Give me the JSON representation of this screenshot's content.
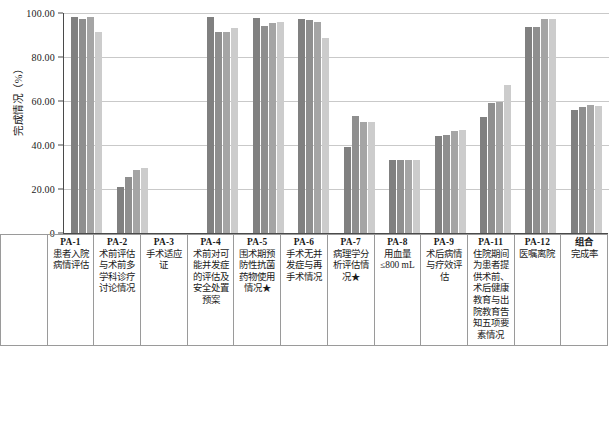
{
  "chart_data": {
    "type": "bar",
    "title": "",
    "xlabel": "",
    "ylabel": "完成情况（%）",
    "ylim": [
      0,
      100
    ],
    "yticks": [
      "0",
      "20.00",
      "40.00",
      "60.00",
      "80.00",
      "100.00"
    ],
    "grid": true,
    "legend_position": "table-left-column",
    "categories": [
      "PA-1",
      "PA-2",
      "PA-3",
      "PA-4",
      "PA-5",
      "PA-6",
      "PA-7",
      "PA-8",
      "PA-9",
      "PA-11",
      "PA-12",
      "组合"
    ],
    "category_descriptions": [
      "患者入院病情评估",
      "术前评估与术前多学科诊疗讨论情况",
      "手术适应证",
      "术前对可能并发症的评估及安全处置预案",
      "围术期预防性抗菌药物使用情况★",
      "手术无并发症与再手术情况",
      "病理学分析评估情况★",
      "用血量≤800 mL",
      "术后病情与疗效评估",
      "住院期间为患者提供术前、术后健康教育与出院教育告知五项要素情况",
      "医嘱离院",
      "完成率"
    ],
    "series": [
      {
        "name": "2019年113例",
        "color": "#808080",
        "values": [
          98.23,
          20.72,
          0,
          98.23,
          97.53,
          97.35,
          38.94,
          33.33,
          43.95,
          52.83,
          93.81,
          56.14
        ]
      },
      {
        "name": "2020年7244例",
        "color": "#8f8f8f",
        "values": [
          97.45,
          25.68,
          0,
          91.2,
          94.15,
          96.81,
          53.13,
          33.32,
          44.34,
          58.95,
          93.53,
          57.34
        ]
      },
      {
        "name": "2021年8237例",
        "color": "#a5a5a5",
        "values": [
          98.2,
          28.6,
          0,
          91.47,
          95.59,
          95.95,
          50.58,
          33.28,
          46.52,
          59.65,
          97.43,
          58.09
        ]
      },
      {
        "name": "2022年8070例",
        "color": "#cccccc",
        "values": [
          91.2,
          29.68,
          0,
          93.06,
          95.85,
          88.48,
          50.54,
          33.31,
          46.65,
          67.09,
          97.46,
          57.8
        ]
      }
    ]
  },
  "table": {
    "header_pa": [
      "PA-1",
      "PA-2",
      "PA-3",
      "PA-4",
      "PA-5",
      "PA-6",
      "PA-7",
      "PA-8",
      "PA-9",
      "PA-11",
      "PA-12",
      "组合"
    ],
    "header_desc": [
      "患者入院病情评估",
      "术前评估与术前多学科诊疗讨论情况",
      "手术适应证",
      "术前对可能并发症的评估及安全处置预案",
      "围术期预防性抗菌药物使用情况★",
      "手术无并发症与再手术情况",
      "病理学分析评估情况★",
      "用血量≤800 mL",
      "术后病情与疗效评估",
      "住院期间为患者提供术前、术后健康教育与出院教育告知五项要素情况",
      "医嘱离院",
      "完成率"
    ],
    "rows": [
      {
        "label": "2019年113例",
        "color": "#808080",
        "cells": [
          "98.23",
          "20.72",
          "0",
          "98.23",
          "97.53",
          "97.35",
          "38.94",
          "33.33",
          "43.95",
          "52.83",
          "93.81",
          "56.14"
        ]
      },
      {
        "label": "2020年7244例",
        "color": "#8f8f8f",
        "cells": [
          "97.45",
          "25.68",
          "0",
          "91.20",
          "94.15",
          "96.81",
          "53.13",
          "33.32",
          "44.34",
          "58.95",
          "93.53",
          "57.34"
        ]
      },
      {
        "label": "2021年8237例",
        "color": "#a5a5a5",
        "cells": [
          "98.20",
          "28.60",
          "0",
          "91.47",
          "95.59",
          "95.95",
          "50.58",
          "33.28",
          "46.52",
          "59.65",
          "97.43",
          "58.09"
        ]
      },
      {
        "label": "2022年8070例",
        "color": "#cccccc",
        "cells": [
          "91.20",
          "29.68",
          "0",
          "93.06",
          "95.85",
          "88.48",
          "50.54",
          "33.31",
          "46.65",
          "67.09",
          "97.46",
          "57.80"
        ]
      }
    ]
  }
}
